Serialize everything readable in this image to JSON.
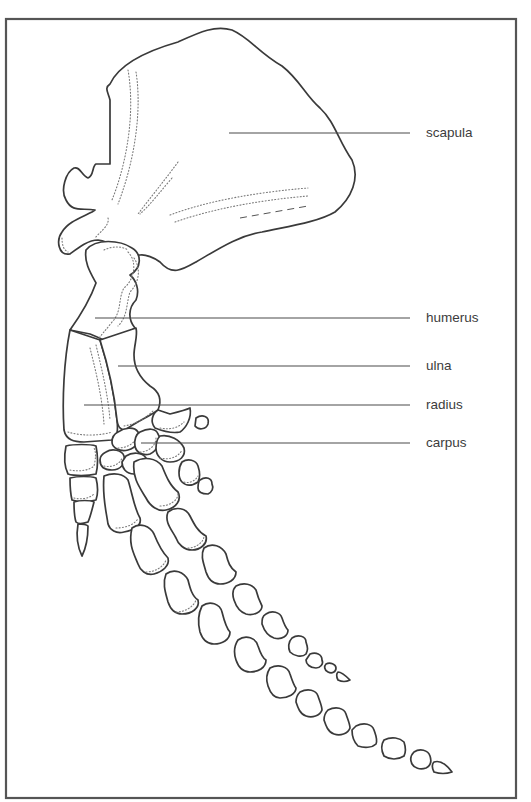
{
  "figure": {
    "frame_color": "#555555",
    "line_color": "#3a3a3a"
  },
  "labels": [
    {
      "key": "scapula",
      "text": "scapula",
      "label_top": 125,
      "line_y": 133,
      "line_x1": 229,
      "line_x2": 410
    },
    {
      "key": "humerus",
      "text": "humerus",
      "label_top": 310,
      "line_y": 318,
      "line_x1": 95,
      "line_x2": 410
    },
    {
      "key": "ulna",
      "text": "ulna",
      "label_top": 358,
      "line_y": 366,
      "line_x1": 118,
      "line_x2": 410
    },
    {
      "key": "radius",
      "text": "radius",
      "label_top": 397,
      "line_y": 405,
      "line_x1": 84,
      "line_x2": 410
    },
    {
      "key": "carpus",
      "text": "carpus",
      "label_top": 435,
      "line_y": 443,
      "line_x1": 141,
      "line_x2": 410
    }
  ]
}
